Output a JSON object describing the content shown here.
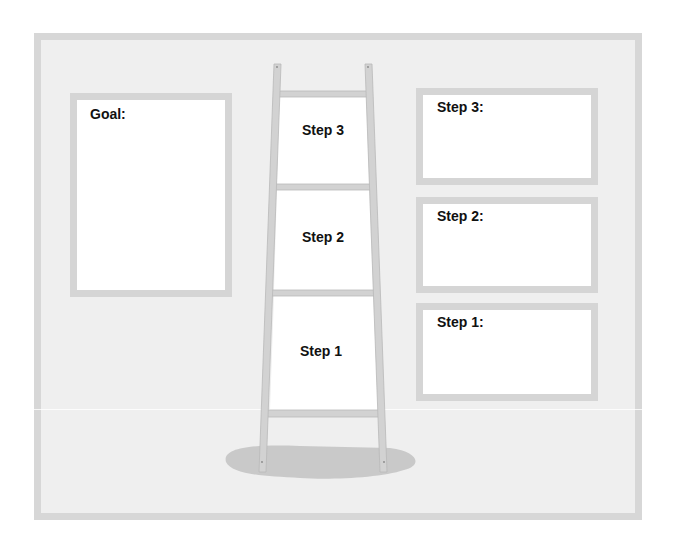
{
  "diagram": {
    "type": "goal-ladder-worksheet",
    "goal_box": {
      "label": "Goal:"
    },
    "ladder": {
      "rungs": [
        {
          "label": "Step 3"
        },
        {
          "label": "Step 2"
        },
        {
          "label": "Step 1"
        }
      ]
    },
    "step_boxes": [
      {
        "label": "Step 3:"
      },
      {
        "label": "Step 2:"
      },
      {
        "label": "Step 1:"
      }
    ]
  },
  "colors": {
    "frame_border": "#d7d7d7",
    "frame_fill": "#efefef",
    "box_border": "#d5d5d5",
    "box_fill": "#ffffff",
    "ladder_wood": "#d2d2d2",
    "ladder_edge": "#b9b9b9",
    "shadow": "#c9c9c9",
    "text": "#111111"
  }
}
